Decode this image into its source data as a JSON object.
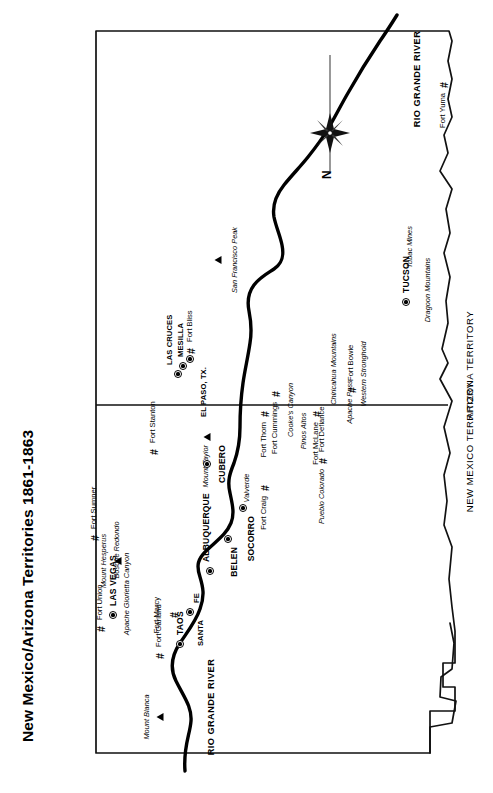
{
  "title": "New Mexico/Arizona Territories 1861-1863",
  "orientation": {
    "page_rotation_deg": -90,
    "compass_north_label": "N",
    "compass_icon": "compass-rose-icon"
  },
  "territories": [
    {
      "name": "NEW MEXICO TERRITORY"
    },
    {
      "name": "ARIZONA TERRITORY"
    }
  ],
  "rivers": [
    {
      "name": "RIO GRANDE RIVER",
      "position": "north"
    },
    {
      "name": "RIO GRANDE RIVER",
      "position": "south"
    }
  ],
  "cities": [
    {
      "label": "TAOS",
      "marker": "city-dot"
    },
    {
      "label": "SANTA",
      "marker": "none"
    },
    {
      "label": "FE",
      "marker": "city-dot"
    },
    {
      "label": "LAS VEGAS",
      "marker": "city-dot"
    },
    {
      "label": "ALBUQUERQUE",
      "marker": "city-dot"
    },
    {
      "label": "CUBERO",
      "marker": "city-dot"
    },
    {
      "label": "BELEN",
      "marker": "city-dot"
    },
    {
      "label": "SOCORRO",
      "marker": "city-dot"
    },
    {
      "label": "LAS CRUCES",
      "marker": "city-dot"
    },
    {
      "label": "MESILLA",
      "marker": "city-dot"
    },
    {
      "label": "EL PASO, TX.",
      "marker": "city-dot"
    },
    {
      "label": "TUCSON",
      "marker": "city-dot"
    }
  ],
  "forts": [
    {
      "label": "Fort Garland",
      "marker": "fort-hash"
    },
    {
      "label": "Fort Union",
      "marker": "fort-hash"
    },
    {
      "label": "Fort Marcy",
      "marker": "fort-hash"
    },
    {
      "label": "Fort Sumner",
      "marker": "fort-hash"
    },
    {
      "label": "Fort Stanton",
      "marker": "fort-hash"
    },
    {
      "label": "Fort Defiance",
      "marker": "fort-hash"
    },
    {
      "label": "Fort Craig",
      "marker": "fort-hash"
    },
    {
      "label": "Fort Thorn",
      "marker": "fort-hash"
    },
    {
      "label": "Fort Bliss",
      "marker": "fort-hash"
    },
    {
      "label": "Fort McLane",
      "marker": "fort-hash"
    },
    {
      "label": "Fort Cummings",
      "marker": "fort-hash"
    },
    {
      "label": "Fort Bowie",
      "marker": "fort-hash"
    },
    {
      "label": "Fort Yuma",
      "marker": "fort-hash"
    }
  ],
  "places": [
    {
      "label": "Apache Glorietta Canyon"
    },
    {
      "label": "Bosque Redondo"
    },
    {
      "label": "Pueblo Colorado"
    },
    {
      "label": "Valverde"
    },
    {
      "label": "Pinos Altos"
    },
    {
      "label": "Cooke's Canyon"
    },
    {
      "label": "Apache Pass"
    },
    {
      "label": "Western Stronghold"
    },
    {
      "label": "Chiricahua Mountains"
    },
    {
      "label": "Dragoon Mountains"
    },
    {
      "label": "Tubac Mines"
    }
  ],
  "mountains": [
    {
      "label": "Mount Blanca",
      "marker": "mountain-triangle"
    },
    {
      "label": "Mount Hesperus",
      "marker": "mountain-triangle"
    },
    {
      "label": "Mount Taylor",
      "marker": "mountain-triangle"
    },
    {
      "label": "San Francisco Peak",
      "marker": "mountain-triangle"
    }
  ],
  "colors": {
    "ink": "#000000",
    "paper": "#ffffff",
    "border": "#1a1a1a"
  },
  "map_geometry": {
    "territory_outline": "M 34,70 L 34,88 L 52,89 L 62,113 L 85,110 L 99,122 L 120,120 L 133,141 L 160,138 L 176,151 L 198,148 L 214,159 L 238,154 L 253,169 L 279,167 L 292,178 L 316,173 L 332,186 L 356,181 L 372,196 L 396,191 L 413,199 L 440,192 L 455,199 L 478,192 L 497,202 L 519,197 L 539,208 L 563,204 L 582,213 L 604,209 L 624,221 L 647,214 L 664,224 L 688,219 L 706,230 L 727,226 L 743,236 L 762,232",
    "rio_grande_north": "RIO GRANDE RIVER flows from upper-left (Colorado border) SE through Taos, Santa Fe, Albuquerque, Belen, Socorro, Fort Craig, Fort Thorn, Las Cruces, Mesilla, El Paso",
    "territory_divider": "vertical line splitting New Mexico Territory (east) from Arizona Territory (west)"
  }
}
